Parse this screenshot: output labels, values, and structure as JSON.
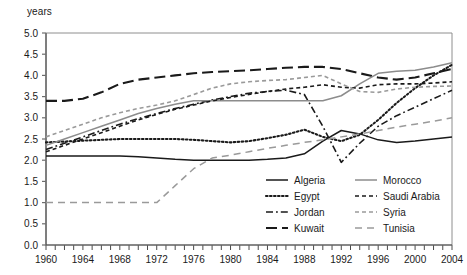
{
  "axis_title": "years",
  "chart_data": {
    "type": "line",
    "title": "",
    "xlabel": "",
    "ylabel": "years",
    "xlim": [
      1960,
      2004
    ],
    "ylim": [
      0.0,
      5.0
    ],
    "grid": false,
    "legend_position": "inside-bottom-right",
    "y_ticks": [
      "0.0",
      "0.5",
      "1.0",
      "1.5",
      "2.0",
      "2.5",
      "3.0",
      "3.5",
      "4.0",
      "4.5",
      "5.0"
    ],
    "x_ticks": [
      "1960",
      "1964",
      "1968",
      "1972",
      "1976",
      "1980",
      "1984",
      "1988",
      "1992",
      "1996",
      "2000",
      "2004"
    ],
    "x_tick_step_minor": 1,
    "x": [
      1960,
      1962,
      1964,
      1966,
      1968,
      1970,
      1972,
      1974,
      1976,
      1978,
      1980,
      1982,
      1984,
      1986,
      1988,
      1990,
      1992,
      1994,
      1996,
      1998,
      2000,
      2002,
      2004
    ],
    "series": [
      {
        "name": "Algeria",
        "style": "solid",
        "color": "#1a1a1a",
        "values": [
          2.1,
          2.1,
          2.1,
          2.1,
          2.1,
          2.08,
          2.05,
          2.02,
          2.0,
          2.0,
          2.0,
          2.0,
          2.02,
          2.05,
          2.15,
          2.45,
          2.7,
          2.62,
          2.48,
          2.42,
          2.45,
          2.5,
          2.55
        ]
      },
      {
        "name": "Egypt",
        "style": "dotted",
        "color": "#1a1a1a",
        "values": [
          2.42,
          2.44,
          2.46,
          2.48,
          2.5,
          2.5,
          2.5,
          2.5,
          2.48,
          2.45,
          2.42,
          2.45,
          2.52,
          2.6,
          2.72,
          2.55,
          2.45,
          2.6,
          2.95,
          3.35,
          3.7,
          4.0,
          4.25
        ]
      },
      {
        "name": "Jordan",
        "style": "dashdot",
        "color": "#1a1a1a",
        "values": [
          2.25,
          2.4,
          2.55,
          2.7,
          2.85,
          2.98,
          3.1,
          3.22,
          3.32,
          3.42,
          3.5,
          3.58,
          3.62,
          3.65,
          3.55,
          2.8,
          1.95,
          2.4,
          2.8,
          3.05,
          3.25,
          3.45,
          3.65
        ]
      },
      {
        "name": "Kuwait",
        "style": "longdash",
        "color": "#1a1a1a",
        "values": [
          3.4,
          3.4,
          3.45,
          3.6,
          3.8,
          3.9,
          3.95,
          4.0,
          4.05,
          4.08,
          4.1,
          4.12,
          4.15,
          4.18,
          4.2,
          4.2,
          4.15,
          4.05,
          3.95,
          3.9,
          3.95,
          4.05,
          4.15
        ]
      },
      {
        "name": "Morocco",
        "style": "solid",
        "color": "#8c8c8c",
        "values": [
          2.35,
          2.5,
          2.65,
          2.8,
          2.95,
          3.1,
          3.22,
          3.32,
          3.4,
          3.4,
          3.4,
          3.4,
          3.4,
          3.4,
          3.4,
          3.4,
          3.52,
          3.8,
          4.05,
          4.1,
          4.12,
          4.2,
          4.3
        ]
      },
      {
        "name": "Saudi Arabia",
        "style": "shortdash",
        "color": "#1a1a1a",
        "values": [
          2.2,
          2.35,
          2.5,
          2.65,
          2.8,
          2.95,
          3.08,
          3.2,
          3.3,
          3.4,
          3.48,
          3.55,
          3.62,
          3.68,
          3.72,
          3.78,
          3.72,
          3.7,
          3.78,
          3.8,
          3.8,
          3.82,
          3.85
        ]
      },
      {
        "name": "Syria",
        "style": "shortdash",
        "color": "#9a9a9a",
        "values": [
          2.55,
          2.7,
          2.85,
          3.0,
          3.12,
          3.22,
          3.3,
          3.4,
          3.55,
          3.7,
          3.8,
          3.85,
          3.88,
          3.9,
          3.95,
          4.0,
          3.8,
          3.62,
          3.6,
          3.68,
          3.72,
          3.74,
          3.75
        ]
      },
      {
        "name": "Tunisia",
        "style": "dash",
        "color": "#9a9a9a",
        "values": [
          1.0,
          1.0,
          1.0,
          1.0,
          1.0,
          1.0,
          1.0,
          1.4,
          1.8,
          2.05,
          2.12,
          2.2,
          2.28,
          2.35,
          2.42,
          2.48,
          2.55,
          2.62,
          2.7,
          2.78,
          2.85,
          2.92,
          3.0
        ]
      }
    ]
  },
  "legend": {
    "column_left": [
      "Algeria",
      "Egypt",
      "Jordan",
      "Kuwait"
    ],
    "column_right": [
      "Morocco",
      "Saudi Arabia",
      "Syria",
      "Tunisia"
    ]
  }
}
